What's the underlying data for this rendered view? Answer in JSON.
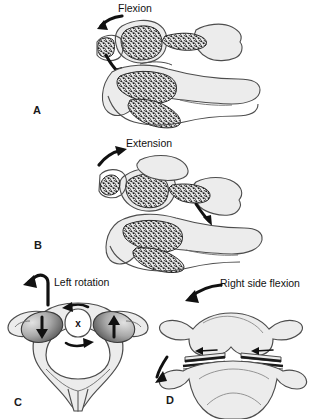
{
  "figure": {
    "background_color": "#ffffff",
    "ink_color": "#1a1a1a",
    "bone_fill": "#e9e9e9",
    "bone_outline": "#4d4d4d",
    "facet_fill_dark": "#6e6e6e",
    "facet_fill_light": "#d8d8d8",
    "trabecular_color": "#1c1c1c"
  },
  "panels": [
    {
      "id": "A",
      "letter": "A",
      "motion_label": "Flexion",
      "view": "lateral",
      "arrow": "curved-arrow-down-left",
      "arrow_direction": "anterior-inferior"
    },
    {
      "id": "B",
      "letter": "B",
      "motion_label": "Extension",
      "view": "lateral",
      "arrow": "curved-arrow-up-right",
      "arrow_direction": "posterior-superior"
    },
    {
      "id": "C",
      "letter": "C",
      "motion_label": "Left rotation",
      "view": "superior",
      "arrow": "hook-arrow-left",
      "axis_marker": "x",
      "facet_arrows": [
        "down",
        "up"
      ]
    },
    {
      "id": "D",
      "letter": "D",
      "motion_label": "Right side flexion",
      "view": "anterior",
      "arrow": "curved-arrow-down-left",
      "facet_arrows": [
        "left",
        "left"
      ]
    }
  ]
}
